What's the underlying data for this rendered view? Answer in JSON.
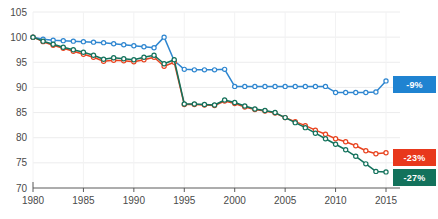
{
  "chart_data": {
    "type": "line",
    "title": "",
    "xlabel": "",
    "ylabel": "",
    "xlim": [
      1980,
      2015
    ],
    "ylim": [
      70,
      105
    ],
    "grid": true,
    "legend_position": "right-inline-badges",
    "xticks": [
      1980,
      1985,
      1990,
      1995,
      2000,
      2005,
      2010,
      2015
    ],
    "yticks": [
      70,
      75,
      80,
      85,
      90,
      95,
      100,
      105
    ],
    "x": [
      1980,
      1981,
      1982,
      1983,
      1984,
      1985,
      1986,
      1987,
      1988,
      1989,
      1990,
      1991,
      1992,
      1993,
      1994,
      1995,
      1996,
      1997,
      1998,
      1999,
      2000,
      2001,
      2002,
      2003,
      2004,
      2005,
      2006,
      2007,
      2008,
      2009,
      2010,
      2011,
      2012,
      2013,
      2014,
      2015
    ],
    "series": [
      {
        "name": "series-blue",
        "color": "#2e86d0",
        "end_label": "-9%",
        "values": [
          100,
          99.6,
          99.4,
          99.3,
          99.2,
          99.1,
          99.0,
          98.9,
          98.7,
          98.5,
          98.3,
          98.1,
          97.9,
          100.0,
          95.3,
          93.6,
          93.5,
          93.5,
          93.5,
          93.6,
          90.2,
          90.2,
          90.2,
          90.2,
          90.2,
          90.2,
          90.2,
          90.2,
          90.2,
          90.2,
          89.0,
          89.0,
          89.0,
          89.0,
          89.1,
          91.3
        ]
      },
      {
        "name": "series-red",
        "color": "#e8431f",
        "end_label": "-23%",
        "values": [
          100,
          99.1,
          98.4,
          97.8,
          97.2,
          96.6,
          96.0,
          95.2,
          95.4,
          95.3,
          95.1,
          95.5,
          96.0,
          94.2,
          95.0,
          86.6,
          86.6,
          86.5,
          86.4,
          87.3,
          86.8,
          86.1,
          85.6,
          85.3,
          84.9,
          84.0,
          83.2,
          82.4,
          81.5,
          80.7,
          79.8,
          79.2,
          78.4,
          77.4,
          76.8,
          77.0
        ]
      },
      {
        "name": "series-green",
        "color": "#13725c",
        "end_label": "-27%",
        "values": [
          100,
          99.2,
          98.6,
          98.0,
          97.5,
          97.0,
          96.4,
          95.6,
          95.9,
          95.7,
          95.5,
          96.0,
          96.4,
          94.7,
          95.5,
          86.7,
          86.7,
          86.6,
          86.5,
          87.5,
          87.0,
          86.3,
          85.7,
          85.4,
          85.0,
          84.0,
          83.0,
          82.0,
          80.9,
          79.8,
          78.7,
          77.6,
          76.3,
          74.8,
          73.3,
          73.2
        ]
      }
    ]
  },
  "axis": {
    "y_labels": [
      "105",
      "100",
      "95",
      "90",
      "85",
      "80",
      "75",
      "70"
    ],
    "x_labels": [
      "1980",
      "1985",
      "1990",
      "1995",
      "2000",
      "2005",
      "2010",
      "2015"
    ]
  },
  "badges": {
    "blue": "-9%",
    "red": "-23%",
    "green": "-27%"
  }
}
